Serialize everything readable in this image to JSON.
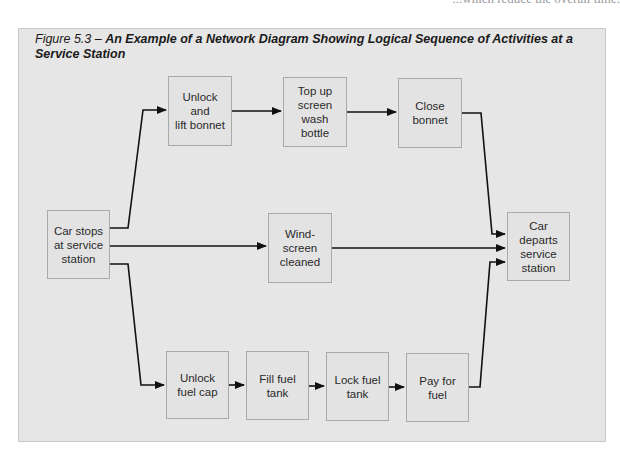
{
  "page_fragment": "...which reduce the overall time.",
  "figure": {
    "label": "Figure 5.3 – ",
    "title": "An Example of a Network Diagram Showing Logical Sequence of Activities at a Service Station"
  },
  "colors": {
    "frame_bg": "#e6e6e6",
    "node_border": "#a9a9a9",
    "arrow": "#111111"
  },
  "nodes": [
    {
      "id": "car-stops",
      "label": "Car stops\nat service\nstation",
      "x": 47,
      "y": 210,
      "w": 63,
      "h": 69
    },
    {
      "id": "unlock-lift-bonnet",
      "label": "Unlock\nand\nlift bonnet",
      "x": 168,
      "y": 76,
      "w": 64,
      "h": 70
    },
    {
      "id": "top-up-wash",
      "label": "Top up\nscreen\nwash\nbottle",
      "x": 283,
      "y": 77,
      "w": 64,
      "h": 70
    },
    {
      "id": "close-bonnet",
      "label": "Close\nbonnet",
      "x": 398,
      "y": 78,
      "w": 64,
      "h": 70
    },
    {
      "id": "windscreen-cleaned",
      "label": "Wind-\nscreen\ncleaned",
      "x": 268,
      "y": 213,
      "w": 64,
      "h": 70
    },
    {
      "id": "unlock-fuel-cap",
      "label": "Unlock\nfuel cap",
      "x": 166,
      "y": 351,
      "w": 63,
      "h": 68
    },
    {
      "id": "fill-fuel-tank",
      "label": "Fill fuel\ntank",
      "x": 246,
      "y": 351,
      "w": 63,
      "h": 69
    },
    {
      "id": "lock-fuel-tank",
      "label": "Lock fuel\ntank",
      "x": 326,
      "y": 352,
      "w": 63,
      "h": 69
    },
    {
      "id": "pay-for-fuel",
      "label": "Pay for\nfuel",
      "x": 406,
      "y": 353,
      "w": 63,
      "h": 69
    },
    {
      "id": "car-departs",
      "label": "Car\ndeparts\nservice\nstation",
      "x": 507,
      "y": 212,
      "w": 63,
      "h": 69
    }
  ],
  "edges": [
    {
      "from": "car-stops",
      "to": "unlock-lift-bonnet",
      "points": "110,228 128,228 143,110 166,110"
    },
    {
      "from": "unlock-lift-bonnet",
      "to": "top-up-wash",
      "points": "232,111 281,111"
    },
    {
      "from": "top-up-wash",
      "to": "close-bonnet",
      "points": "347,112 396,112"
    },
    {
      "from": "close-bonnet",
      "to": "car-departs",
      "points": "462,113 481,113 492,234 505,234"
    },
    {
      "from": "car-stops",
      "to": "windscreen-cleaned",
      "points": "110,246 266,246"
    },
    {
      "from": "windscreen-cleaned",
      "to": "car-departs",
      "points": "332,248 505,248"
    },
    {
      "from": "car-stops",
      "to": "unlock-fuel-cap",
      "points": "110,264 128,264 141,385 164,385"
    },
    {
      "from": "unlock-fuel-cap",
      "to": "fill-fuel-tank",
      "points": "229,385 244,385"
    },
    {
      "from": "fill-fuel-tank",
      "to": "lock-fuel-tank",
      "points": "309,386 324,386"
    },
    {
      "from": "lock-fuel-tank",
      "to": "pay-for-fuel",
      "points": "389,387 404,387"
    },
    {
      "from": "pay-for-fuel",
      "to": "car-departs",
      "points": "469,387 480,387 490,262 505,262"
    }
  ]
}
